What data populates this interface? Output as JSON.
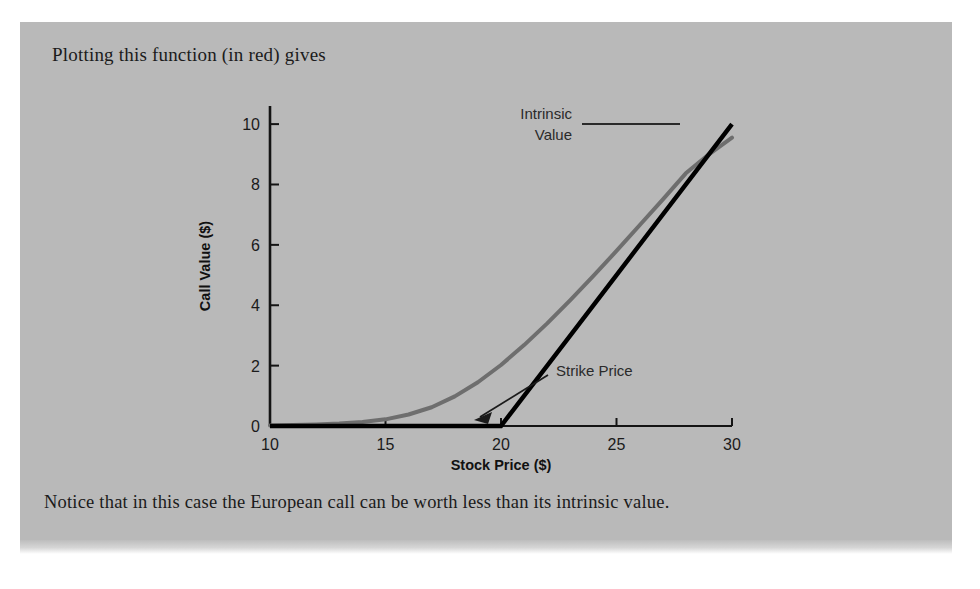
{
  "page": {
    "intro_text": "Plotting this function (in red) gives",
    "caption_text": "Notice that in this case the European call can be worth less than its intrinsic value.",
    "panel_color": "#b9b9b9"
  },
  "chart_data": {
    "type": "line",
    "title": "",
    "xlabel": "Stock Price ($)",
    "ylabel": "Call Value ($)",
    "xlim": [
      10,
      30
    ],
    "ylim": [
      0,
      10.6
    ],
    "xticks": [
      "10",
      "15",
      "20",
      "25",
      "30"
    ],
    "yticks": [
      "0",
      "2",
      "4",
      "6",
      "8",
      "10"
    ],
    "grid": false,
    "legend": "none",
    "strike": 20,
    "series": [
      {
        "name": "Intrinsic Value",
        "color": "#000000",
        "width": 4,
        "x": [
          10,
          15,
          20,
          25,
          30
        ],
        "values": [
          0,
          0,
          0,
          5,
          10
        ]
      },
      {
        "name": "Call Value",
        "color": "#6e6e6e",
        "width": 4,
        "x": [
          10,
          11,
          12,
          13,
          14,
          15,
          16,
          17,
          18,
          19,
          20,
          21,
          22,
          23,
          24,
          25,
          26,
          27,
          28,
          29,
          30
        ],
        "values": [
          0.02,
          0.03,
          0.05,
          0.08,
          0.13,
          0.22,
          0.38,
          0.62,
          0.98,
          1.45,
          2.02,
          2.68,
          3.4,
          4.17,
          4.97,
          5.8,
          6.65,
          7.5,
          8.37,
          9.0,
          9.55
        ]
      }
    ],
    "annotations": [
      {
        "name": "intrinsic-value",
        "label_line1": "Intrinsic",
        "label_line2": "Value",
        "points_to_x": 28.2,
        "points_to_y": 8.2
      },
      {
        "name": "strike-price",
        "label": "Strike Price",
        "points_to_x": 20,
        "points_to_y": 0
      }
    ]
  }
}
